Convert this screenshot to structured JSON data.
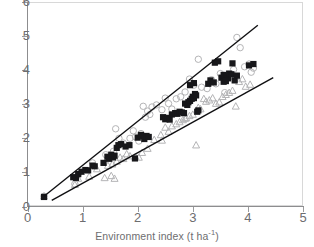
{
  "chart_data": {
    "type": "scatter",
    "title": "",
    "xlabel_text": "Environment index (t ha",
    "xlabel_sup": "-1",
    "xlabel_tail": ")",
    "ylabel": "",
    "xlim": [
      0,
      5
    ],
    "ylim": [
      0,
      6
    ],
    "xticks": [
      0,
      1,
      2,
      3,
      4,
      5
    ],
    "yticks": [
      0,
      1,
      2,
      3,
      4,
      5,
      6
    ],
    "xtick_labels": [
      "0",
      "1",
      "2",
      "3",
      "4",
      "5"
    ],
    "ytick_labels": [
      "0",
      "1",
      "2",
      "3",
      "4",
      "5",
      "6"
    ],
    "grid": false,
    "legend": "none",
    "marker_colors": {
      "filled_square": "#17171a",
      "open_circle": "#b4b4b6",
      "open_triangle": "#b4b4b6"
    },
    "series": [
      {
        "name": "filled square",
        "marker": "filled-square",
        "points": [
          [
            0.3,
            0.28
          ],
          [
            0.83,
            0.86
          ],
          [
            0.88,
            0.84
          ],
          [
            0.92,
            0.95
          ],
          [
            0.98,
            1.02
          ],
          [
            1.05,
            1.07
          ],
          [
            1.1,
            1.06
          ],
          [
            1.18,
            1.2
          ],
          [
            1.22,
            1.18
          ],
          [
            1.38,
            1.28
          ],
          [
            1.45,
            1.46
          ],
          [
            1.48,
            1.4
          ],
          [
            1.52,
            1.52
          ],
          [
            1.55,
            1.44
          ],
          [
            1.58,
            1.49
          ],
          [
            1.62,
            1.72
          ],
          [
            1.65,
            1.8
          ],
          [
            1.7,
            1.83
          ],
          [
            1.78,
            1.76
          ],
          [
            1.85,
            1.8
          ],
          [
            1.95,
            1.41
          ],
          [
            2.0,
            2.02
          ],
          [
            2.06,
            2.1
          ],
          [
            2.1,
            2.06
          ],
          [
            2.12,
            1.98
          ],
          [
            2.16,
            2.07
          ],
          [
            2.2,
            2.04
          ],
          [
            2.46,
            2.62
          ],
          [
            2.5,
            2.56
          ],
          [
            2.54,
            2.6
          ],
          [
            2.58,
            2.55
          ],
          [
            2.62,
            2.7
          ],
          [
            2.68,
            2.74
          ],
          [
            2.72,
            2.72
          ],
          [
            2.76,
            2.78
          ],
          [
            2.8,
            2.76
          ],
          [
            2.84,
            2.74
          ],
          [
            2.86,
            3.02
          ],
          [
            2.9,
            2.98
          ],
          [
            2.92,
            3.06
          ],
          [
            2.95,
            3.1
          ],
          [
            2.98,
            3.16
          ],
          [
            3.0,
            3.22
          ],
          [
            3.02,
            3.18
          ],
          [
            3.04,
            3.3
          ],
          [
            3.06,
            3.26
          ],
          [
            3.08,
            2.78
          ],
          [
            3.1,
            2.82
          ],
          [
            2.95,
            3.56
          ],
          [
            3.02,
            3.62
          ],
          [
            3.28,
            3.6
          ],
          [
            3.32,
            3.7
          ],
          [
            3.38,
            3.64
          ],
          [
            3.4,
            4.22
          ],
          [
            3.46,
            4.26
          ],
          [
            3.52,
            3.78
          ],
          [
            3.56,
            3.86
          ],
          [
            3.58,
            3.72
          ],
          [
            3.62,
            3.82
          ],
          [
            3.64,
            3.76
          ],
          [
            3.66,
            3.9
          ],
          [
            3.7,
            3.88
          ],
          [
            3.72,
            4.2
          ],
          [
            3.76,
            3.7
          ],
          [
            3.8,
            3.84
          ],
          [
            4.02,
            4.14
          ],
          [
            4.1,
            4.18
          ],
          [
            3.56,
            3.66
          ],
          [
            3.6,
            3.68
          ]
        ]
      },
      {
        "name": "open circle",
        "marker": "open-circle",
        "points": [
          [
            0.3,
            0.3
          ],
          [
            0.86,
            0.66
          ],
          [
            0.92,
            0.94
          ],
          [
            1.18,
            1.28
          ],
          [
            1.42,
            1.52
          ],
          [
            1.5,
            1.44
          ],
          [
            1.56,
            1.62
          ],
          [
            1.6,
            2.28
          ],
          [
            1.74,
            1.86
          ],
          [
            1.86,
            2.0
          ],
          [
            1.92,
            2.22
          ],
          [
            1.96,
            2.04
          ],
          [
            2.02,
            1.92
          ],
          [
            2.06,
            2.14
          ],
          [
            2.1,
            2.94
          ],
          [
            2.14,
            2.62
          ],
          [
            2.18,
            2.8
          ],
          [
            2.26,
            2.92
          ],
          [
            2.34,
            2.98
          ],
          [
            2.44,
            2.84
          ],
          [
            2.5,
            3.18
          ],
          [
            2.56,
            3.02
          ],
          [
            2.62,
            2.86
          ],
          [
            2.7,
            3.16
          ],
          [
            2.78,
            3.22
          ],
          [
            2.86,
            3.36
          ],
          [
            2.94,
            3.74
          ],
          [
            2.98,
            3.62
          ],
          [
            3.02,
            3.56
          ],
          [
            3.1,
            4.32
          ],
          [
            3.16,
            3.5
          ],
          [
            3.26,
            3.46
          ],
          [
            3.34,
            3.72
          ],
          [
            3.42,
            3.6
          ],
          [
            3.5,
            3.9
          ],
          [
            3.58,
            3.34
          ],
          [
            3.66,
            3.8
          ],
          [
            3.74,
            4.02
          ],
          [
            3.8,
            4.96
          ],
          [
            3.86,
            4.66
          ],
          [
            3.94,
            4.1
          ],
          [
            4.02,
            4.18
          ],
          [
            4.06,
            3.94
          ],
          [
            4.1,
            4.06
          ],
          [
            2.22,
            2.7
          ],
          [
            1.66,
            2.0
          ]
        ]
      },
      {
        "name": "open triangle",
        "marker": "open-triangle",
        "points": [
          [
            0.3,
            0.3
          ],
          [
            0.86,
            0.64
          ],
          [
            0.92,
            0.82
          ],
          [
            1.12,
            0.88
          ],
          [
            1.26,
            1.1
          ],
          [
            1.4,
            0.84
          ],
          [
            1.46,
            1.2
          ],
          [
            1.52,
            0.9
          ],
          [
            1.58,
            0.82
          ],
          [
            1.62,
            1.32
          ],
          [
            1.68,
            1.44
          ],
          [
            1.74,
            1.4
          ],
          [
            1.8,
            1.54
          ],
          [
            1.86,
            1.48
          ],
          [
            1.96,
            1.46
          ],
          [
            2.02,
            1.44
          ],
          [
            2.08,
            1.58
          ],
          [
            2.18,
            1.7
          ],
          [
            2.3,
            1.96
          ],
          [
            2.42,
            2.1
          ],
          [
            2.5,
            2.32
          ],
          [
            2.56,
            2.2
          ],
          [
            2.62,
            2.36
          ],
          [
            2.7,
            2.42
          ],
          [
            2.76,
            2.48
          ],
          [
            2.82,
            2.54
          ],
          [
            2.88,
            2.6
          ],
          [
            2.94,
            2.66
          ],
          [
            3.0,
            2.7
          ],
          [
            3.06,
            1.8
          ],
          [
            3.1,
            2.9
          ],
          [
            3.14,
            2.86
          ],
          [
            3.2,
            3.16
          ],
          [
            3.24,
            3.08
          ],
          [
            3.3,
            3.12
          ],
          [
            3.36,
            3.18
          ],
          [
            3.42,
            3.02
          ],
          [
            3.48,
            3.06
          ],
          [
            3.54,
            3.22
          ],
          [
            3.6,
            3.28
          ],
          [
            3.66,
            3.34
          ],
          [
            3.72,
            3.4
          ],
          [
            3.78,
            2.94
          ],
          [
            3.84,
            3.66
          ],
          [
            3.9,
            3.74
          ],
          [
            3.96,
            3.52
          ],
          [
            4.04,
            3.58
          ],
          [
            2.86,
            2.58
          ],
          [
            2.44,
            1.94
          ],
          [
            1.54,
            1.24
          ]
        ]
      }
    ],
    "trend_lines": [
      {
        "name": "upper-bound-line",
        "x0": 0.3,
        "y0": 0.3,
        "x1": 4.18,
        "y1": 5.32
      },
      {
        "name": "lower-bound-line",
        "x0": 0.44,
        "y0": 0.18,
        "x1": 4.46,
        "y1": 3.78
      }
    ]
  }
}
